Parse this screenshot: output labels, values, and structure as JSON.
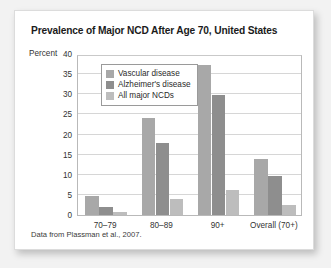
{
  "card": {
    "title": "Prevalence of Major NCD After Age 70, United States",
    "source_note": "Data from Plassman et al., 2007."
  },
  "chart_data": {
    "type": "bar",
    "title": "Prevalence of Major NCD After Age 70, United States",
    "xlabel": "",
    "ylabel": "Percent",
    "ylim": [
      0,
      40
    ],
    "yticks": [
      0,
      5,
      10,
      15,
      20,
      25,
      30,
      35,
      40
    ],
    "ytick_labels": [
      "0",
      "5",
      "10",
      "15",
      "20",
      "25",
      "30",
      "35",
      "40"
    ],
    "grid": true,
    "legend_position": "upper-left-inside",
    "categories": [
      "70–79",
      "80–89",
      "90+",
      "Overall (70+)"
    ],
    "series": [
      {
        "name": "Vascular disease",
        "color": "#a8a8a8",
        "values": [
          4.8,
          24.1,
          37.3,
          13.9
        ]
      },
      {
        "name": "Alzheimer's disease",
        "color": "#8e8e8e",
        "values": [
          2.1,
          18.0,
          29.7,
          9.7
        ]
      },
      {
        "name": "All major NCDs",
        "color": "#bdbdbd",
        "values": [
          0.8,
          4.0,
          6.1,
          2.4
        ]
      }
    ],
    "annotations": [
      "Data from Plassman et al., 2007."
    ]
  }
}
